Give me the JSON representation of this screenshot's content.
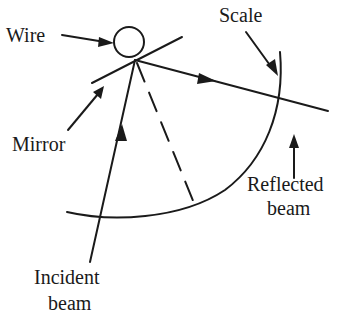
{
  "diagram": {
    "type": "physics-schematic",
    "labels": {
      "wire": "Wire",
      "scale": "Scale",
      "mirror": "Mirror",
      "reflected_line1": "Reflected",
      "reflected_line2": "beam",
      "incident_line1": "Incident",
      "incident_line2": "beam"
    },
    "elements": [
      {
        "name": "wire",
        "shape": "circle"
      },
      {
        "name": "mirror",
        "shape": "line"
      },
      {
        "name": "incident-beam",
        "shape": "arrow-line"
      },
      {
        "name": "reflected-beam",
        "shape": "arrow-line"
      },
      {
        "name": "normal",
        "shape": "dashed-line"
      },
      {
        "name": "scale",
        "shape": "arc"
      }
    ],
    "colors": {
      "ink": "#1a1a1a",
      "background": "#ffffff"
    }
  }
}
